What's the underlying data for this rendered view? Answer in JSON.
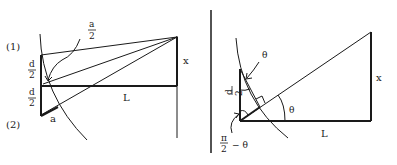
{
  "left_diagram": {
    "labels": {
      "point1": "(1)",
      "point2": "(2)",
      "half_a_num": "a",
      "half_a_den": "2",
      "d_upper_num": "d",
      "d_upper_den": "2",
      "d_lower_num": "d",
      "d_lower_den": "2",
      "x": "x",
      "L": "L",
      "a": "a"
    }
  },
  "right_diagram": {
    "labels": {
      "theta_top": "θ",
      "d_num": "d",
      "d_den": "2",
      "theta_angle": "θ",
      "x": "x",
      "L": "L",
      "pi_num": "π",
      "pi_den": "2",
      "minus_theta": "−  θ"
    }
  },
  "colors": {
    "ink": "#1a1a1a",
    "background": "#ffffff"
  }
}
